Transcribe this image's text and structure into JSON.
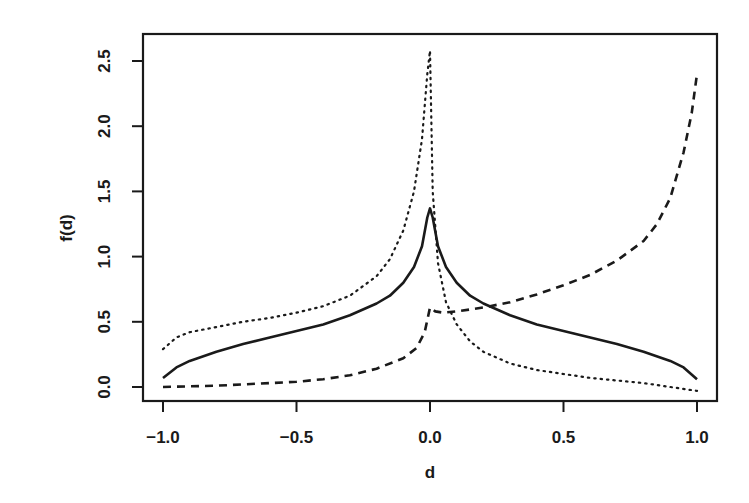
{
  "chart_data": {
    "type": "line",
    "title": "",
    "xlabel": "d",
    "ylabel": "f(d)",
    "xlim": [
      -1.0,
      1.0
    ],
    "ylim": [
      0.0,
      2.5
    ],
    "x_ticks": [
      "-1.0",
      "-0.5",
      "0.0",
      "0.5",
      "1.0"
    ],
    "x_tick_values": [
      -1.0,
      -0.5,
      0.0,
      0.5,
      1.0
    ],
    "y_ticks": [
      "0.0",
      "0.5",
      "1.0",
      "1.5",
      "2.0",
      "2.5"
    ],
    "y_tick_values": [
      0.0,
      0.5,
      1.0,
      1.5,
      2.0,
      2.5
    ],
    "grid": false,
    "legend": null,
    "series": [
      {
        "name": "solid",
        "style": "solid",
        "color": "#1a1a1a",
        "x": [
          -1.0,
          -0.95,
          -0.9,
          -0.8,
          -0.7,
          -0.6,
          -0.5,
          -0.4,
          -0.3,
          -0.2,
          -0.15,
          -0.1,
          -0.06,
          -0.03,
          -0.01,
          0.0,
          0.01,
          0.03,
          0.06,
          0.1,
          0.15,
          0.2,
          0.3,
          0.4,
          0.5,
          0.6,
          0.7,
          0.8,
          0.9,
          0.95,
          1.0
        ],
        "y": [
          0.07,
          0.15,
          0.2,
          0.27,
          0.33,
          0.38,
          0.43,
          0.48,
          0.55,
          0.64,
          0.7,
          0.8,
          0.92,
          1.08,
          1.3,
          1.37,
          1.3,
          1.08,
          0.92,
          0.8,
          0.7,
          0.64,
          0.55,
          0.48,
          0.43,
          0.38,
          0.33,
          0.27,
          0.2,
          0.15,
          0.06
        ]
      },
      {
        "name": "dotted",
        "style": "dotted",
        "color": "#1a1a1a",
        "x": [
          -1.0,
          -0.95,
          -0.9,
          -0.8,
          -0.7,
          -0.6,
          -0.5,
          -0.4,
          -0.3,
          -0.2,
          -0.15,
          -0.1,
          -0.06,
          -0.03,
          -0.01,
          0.0,
          0.01,
          0.03,
          0.06,
          0.1,
          0.15,
          0.2,
          0.3,
          0.4,
          0.5,
          0.6,
          0.7,
          0.8,
          0.9,
          1.0
        ],
        "y": [
          0.29,
          0.38,
          0.42,
          0.46,
          0.5,
          0.53,
          0.57,
          0.62,
          0.7,
          0.85,
          0.98,
          1.2,
          1.5,
          1.9,
          2.4,
          2.58,
          1.5,
          0.95,
          0.65,
          0.48,
          0.35,
          0.27,
          0.18,
          0.13,
          0.1,
          0.07,
          0.05,
          0.03,
          0.0,
          -0.03
        ]
      },
      {
        "name": "dashed",
        "style": "dashed",
        "color": "#1a1a1a",
        "x": [
          -1.0,
          -0.8,
          -0.6,
          -0.5,
          -0.4,
          -0.3,
          -0.2,
          -0.1,
          -0.05,
          -0.02,
          0.0,
          0.02,
          0.05,
          0.1,
          0.2,
          0.3,
          0.4,
          0.5,
          0.6,
          0.7,
          0.8,
          0.85,
          0.9,
          0.95,
          0.98,
          1.0
        ],
        "y": [
          0.0,
          0.01,
          0.03,
          0.04,
          0.06,
          0.09,
          0.14,
          0.22,
          0.3,
          0.42,
          0.61,
          0.58,
          0.57,
          0.58,
          0.61,
          0.65,
          0.71,
          0.78,
          0.86,
          0.97,
          1.12,
          1.25,
          1.45,
          1.8,
          2.1,
          2.4
        ]
      }
    ]
  },
  "labels": {
    "xlabel": "d",
    "ylabel": "f(d)",
    "x_ticks": [
      "-1.0",
      "-0.5",
      "0.0",
      "0.5",
      "1.0"
    ],
    "y_ticks": [
      "0.0",
      "0.5",
      "1.0",
      "1.5",
      "2.0",
      "2.5"
    ]
  }
}
